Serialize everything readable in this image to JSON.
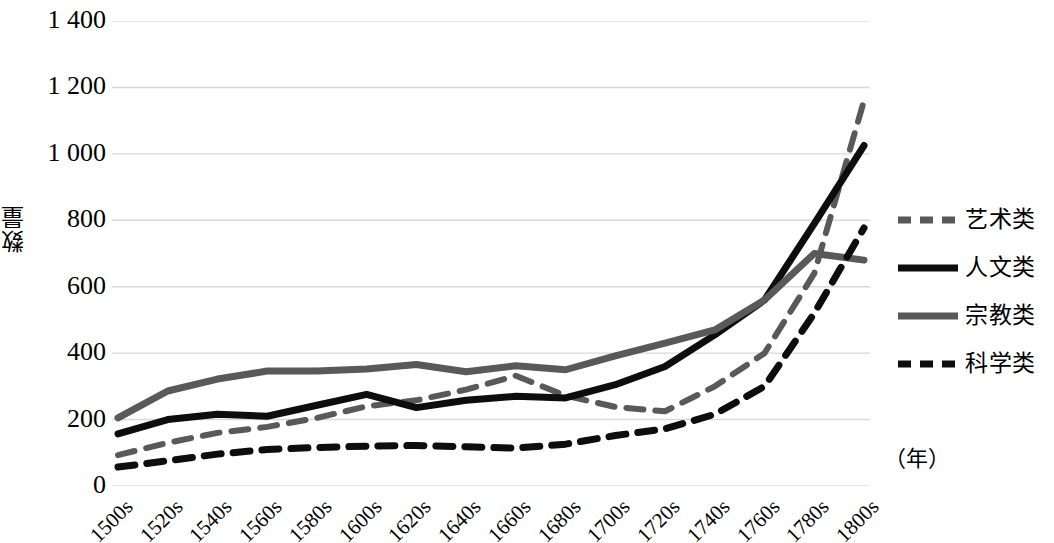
{
  "chart_data": {
    "type": "line",
    "title": "",
    "xlabel": "（年）",
    "ylabel": "数量",
    "ylim": [
      0,
      1400
    ],
    "ytick_values": [
      1400,
      1200,
      1000,
      800,
      600,
      400,
      200,
      0
    ],
    "ytick_labels": [
      "1 400",
      "1 200",
      "1 000",
      "800",
      "600",
      "400",
      "200",
      "0"
    ],
    "grid": true,
    "legend_position": "right",
    "categories": [
      "1500s",
      "1520s",
      "1540s",
      "1560s",
      "1580s",
      "1600s",
      "1620s",
      "1640s",
      "1660s",
      "1680s",
      "1700s",
      "1720s",
      "1740s",
      "1760s",
      "1780s",
      "1800s"
    ],
    "series": [
      {
        "name": "艺术类",
        "color": "#595959",
        "style": "dashed",
        "width": 6,
        "values": [
          93,
          130,
          160,
          178,
          205,
          240,
          258,
          290,
          332,
          272,
          238,
          225,
          300,
          400,
          640,
          1160
        ]
      },
      {
        "name": "人文类",
        "color": "#0d0d0d",
        "style": "solid",
        "width": 7,
        "values": [
          157,
          200,
          216,
          210,
          243,
          276,
          236,
          258,
          270,
          265,
          305,
          360,
          455,
          560,
          790,
          1025
        ]
      },
      {
        "name": "宗教类",
        "color": "#595959",
        "style": "solid",
        "width": 7,
        "values": [
          205,
          286,
          322,
          346,
          346,
          352,
          366,
          344,
          362,
          350,
          392,
          430,
          470,
          560,
          700,
          680
        ]
      },
      {
        "name": "科学类",
        "color": "#0d0d0d",
        "style": "dashed",
        "width": 7,
        "values": [
          57,
          76,
          96,
          110,
          116,
          120,
          122,
          118,
          114,
          126,
          152,
          172,
          216,
          300,
          520,
          777
        ]
      }
    ]
  },
  "legend": {
    "items": [
      {
        "label": "艺术类"
      },
      {
        "label": "人文类"
      },
      {
        "label": "宗教类"
      },
      {
        "label": "科学类"
      }
    ]
  },
  "axes": {
    "y_title": "数量",
    "x_unit": "（年）"
  },
  "colors": {
    "dark": "#0d0d0d",
    "gray": "#595959",
    "gridline": "#d9d9d9",
    "background": "#ffffff"
  }
}
